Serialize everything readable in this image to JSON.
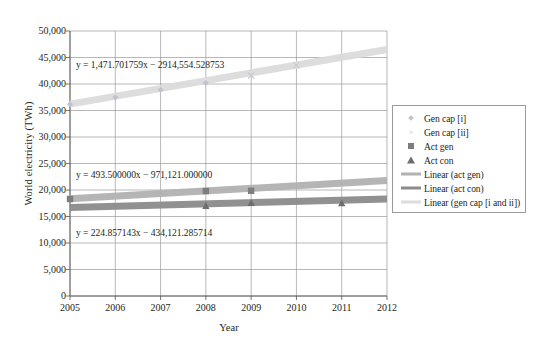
{
  "chart_data": {
    "type": "scatter",
    "title": "",
    "xlabel": "Year",
    "ylabel": "World electricity (TWh)",
    "xlim": [
      2005,
      2012
    ],
    "ylim": [
      0,
      50000
    ],
    "ytick_step": 5000,
    "grid": true,
    "legend_position": "right",
    "x_ticks": [
      "2005",
      "2006",
      "2007",
      "2008",
      "2009",
      "2010",
      "2011",
      "2012"
    ],
    "y_ticks": [
      "0",
      "5,000",
      "10,000",
      "15,000",
      "20,000",
      "25,000",
      "30,000",
      "35,000",
      "40,000",
      "45,000",
      "50,000"
    ],
    "series": [
      {
        "name": "Gen cap [i]",
        "marker": "diamond",
        "color": "#bfc4cc",
        "x": [
          2005,
          2006,
          2007,
          2008
        ],
        "values": [
          36200,
          37500,
          38900,
          40200
        ]
      },
      {
        "name": "Gen cap [ii]",
        "marker": "cross",
        "color": "#c9ccd2",
        "x": [
          2009,
          2010
        ],
        "values": [
          41600,
          43500
        ]
      },
      {
        "name": "Act gen",
        "marker": "square",
        "color": "#7e7e7e",
        "x": [
          2005,
          2008,
          2009
        ],
        "values": [
          18300,
          19800,
          19850
        ]
      },
      {
        "name": "Act con",
        "marker": "triangle",
        "color": "#6d6d6d",
        "x": [
          2008,
          2009,
          2011
        ],
        "values": [
          17000,
          17600,
          17550
        ]
      }
    ],
    "trendlines": [
      {
        "name": "Linear (act gen)",
        "color": "#b2b2b2",
        "slope": 493.5,
        "intercept": -971121.0,
        "equation": "y = 493.500000x − 971,121.000000"
      },
      {
        "name": "Linear (act con)",
        "color": "#8c8c8c",
        "slope": 224.857143,
        "intercept": -434121.285714,
        "equation": "y = 224.857143x − 434,121.285714"
      },
      {
        "name": "Linear (gen cap [i and ii])",
        "color": "#dcdcdc",
        "slope": 1471.701759,
        "intercept": -2914554.528753,
        "equation": "y = 1,471.701759x − 2914,554.528753"
      }
    ],
    "annotations": [
      {
        "text": "y = 1,471.701759x − 2914,554.528753",
        "x_px": 76,
        "y_px": 59
      },
      {
        "text": "y = 493.500000x − 971,121.000000",
        "x_px": 76,
        "y_px": 169
      },
      {
        "text": "y = 224.857143x − 434,121.285714",
        "x_px": 76,
        "y_px": 227
      }
    ],
    "legend": [
      {
        "label": "Gen cap [i]",
        "marker": "diamond"
      },
      {
        "label": "Gen cap [ii]",
        "marker": "cross"
      },
      {
        "label": "Act gen",
        "marker": "square"
      },
      {
        "label": "Act con",
        "marker": "triangle"
      },
      {
        "label": "Linear (act gen)",
        "marker": "line-actgen"
      },
      {
        "label": "Linear (act con)",
        "marker": "line-actcon"
      },
      {
        "label": "Linear (gen cap [i and ii])",
        "marker": "line-gencap"
      }
    ]
  }
}
